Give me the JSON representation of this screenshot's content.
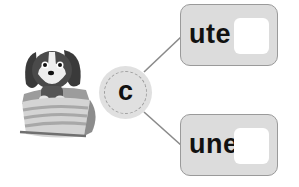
{
  "center_letter": "c",
  "options": [
    {
      "word": "ute",
      "answer": ""
    },
    {
      "word": "une",
      "answer": ""
    }
  ],
  "image": {
    "subject": "dog-in-basket-icon"
  },
  "colors": {
    "box_fill": "#dcdcdc",
    "box_border": "#9a9a9a",
    "circle_fill": "#e0e0e0",
    "line": "#8a8a8a"
  }
}
